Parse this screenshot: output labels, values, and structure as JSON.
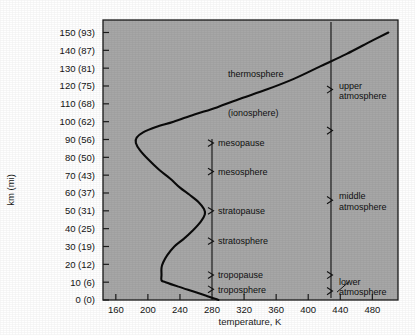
{
  "chart_data": {
    "type": "line",
    "title": "",
    "xlabel": "temperature, K",
    "ylabel": "km (mi)",
    "xlim": [
      144,
      512
    ],
    "ylim": [
      0,
      157
    ],
    "grid": false,
    "legend": "none",
    "x_ticks": [
      160,
      200,
      240,
      280,
      320,
      360,
      400,
      440,
      480
    ],
    "x_tick_labels": [
      "160",
      "200",
      "240",
      "280",
      "320",
      "360",
      "400",
      "440",
      "480"
    ],
    "y_ticks": [
      0,
      10,
      20,
      30,
      40,
      50,
      60,
      70,
      80,
      90,
      100,
      110,
      120,
      130,
      140,
      150
    ],
    "y_tick_labels": [
      "0 (0)",
      "10 (6)",
      "20 (12)",
      "30 (19)",
      "40 (25)",
      "50 (31)",
      "60 (37)",
      "70 (43)",
      "80 (50)",
      "90 (56)",
      "100 (62)",
      "110 (68)",
      "120 (75)",
      "130 (81)",
      "140 (87)",
      "150 (93)"
    ],
    "series": [
      {
        "name": "standard atmosphere temperature profile",
        "x_values": [
          288,
          272,
          255,
          238,
          222,
          217,
          217,
          217,
          219,
          224,
          233,
          244,
          256,
          266,
          271,
          270,
          263,
          252,
          240,
          228,
          214,
          200,
          190,
          185,
          186,
          194,
          210,
          232,
          258,
          286,
          316,
          348,
          382,
          415,
          448,
          478,
          500
        ],
        "y_values": [
          0,
          2.5,
          5,
          7.5,
          10,
          11,
          14,
          18,
          21,
          25,
          30,
          34,
          39,
          44,
          48,
          51,
          55,
          59,
          63,
          68,
          73,
          79,
          84,
          88,
          91,
          94,
          97,
          100,
          104,
          108,
          113,
          118,
          124,
          131,
          138,
          145,
          150
        ]
      }
    ],
    "annotations": [
      {
        "label": "thermosphere",
        "km": 127,
        "kind": "layer-free"
      },
      {
        "label": "(ionosphere)",
        "km": 105,
        "kind": "layer-free"
      },
      {
        "label": "mesopause",
        "km": 88,
        "kind": "layer-bracket"
      },
      {
        "label": "mesosphere",
        "km": 72,
        "kind": "layer-bracket"
      },
      {
        "label": "stratopause",
        "km": 50,
        "kind": "layer-bracket"
      },
      {
        "label": "stratosphere",
        "km": 33,
        "kind": "layer-bracket"
      },
      {
        "label": "tropopause",
        "km": 14,
        "kind": "layer-bracket"
      },
      {
        "label": "troposphere",
        "km": 6,
        "kind": "layer-bracket"
      },
      {
        "label": "upper atmosphere",
        "line1": "upper",
        "line2": "atmosphere",
        "km": 118,
        "kind": "region-bracket"
      },
      {
        "label": "middle atmosphere",
        "line1": "middle",
        "line2": "atmosphere",
        "km": 56,
        "kind": "region-bracket"
      },
      {
        "label": "lower atmosphere",
        "line1": "lower",
        "line2": "atmosphere",
        "km": 8,
        "kind": "region-bracket"
      }
    ]
  },
  "colors": {
    "plot_background": "#a7a7a7",
    "page_background": "#ffffff",
    "axis": "#1b1b1b",
    "curve": "#0a0a0a",
    "text": "#121212"
  }
}
